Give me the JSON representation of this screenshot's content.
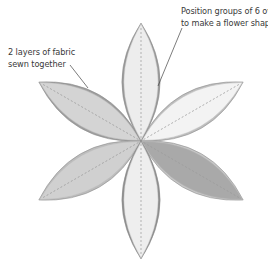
{
  "diagram": {
    "center": [
      141,
      141
    ],
    "petal_length": 118,
    "petal_half_width": 26,
    "petals": [
      {
        "name": "petal-top",
        "angle": -90,
        "fill": "#ededed",
        "rim": "#9a9a9a",
        "layer": 2
      },
      {
        "name": "petal-upper-right",
        "angle": -30,
        "fill": "#f3f3f3",
        "rim": "#bdbdbd",
        "layer": 1
      },
      {
        "name": "petal-lower-right",
        "angle": 30,
        "fill": "#a9a9a9",
        "rim": "#c7c7c7",
        "layer": 1
      },
      {
        "name": "petal-bottom",
        "angle": 90,
        "fill": "#eeeeee",
        "rim": "#8f8f8f",
        "layer": 3
      },
      {
        "name": "petal-lower-left",
        "angle": 150,
        "fill": "#d0d0d0",
        "rim": "#bcbcbc",
        "layer": 2
      },
      {
        "name": "petal-upper-left",
        "angle": 210,
        "fill": "#d4d4d4",
        "rim": "#9e9e9e",
        "layer": 1
      }
    ],
    "seam_color": "#9a9a9a",
    "leader_color": "#444444"
  },
  "annotations": {
    "right": {
      "line1": "Position groups of 6 ovals",
      "line2": "to make a flower shape",
      "leader": [
        [
          182,
          28
        ],
        [
          158,
          86
        ]
      ]
    },
    "left": {
      "line1": "2 layers of fabric",
      "line2": "sewn together",
      "leader": [
        [
          70,
          65
        ],
        [
          88,
          88
        ]
      ]
    }
  }
}
